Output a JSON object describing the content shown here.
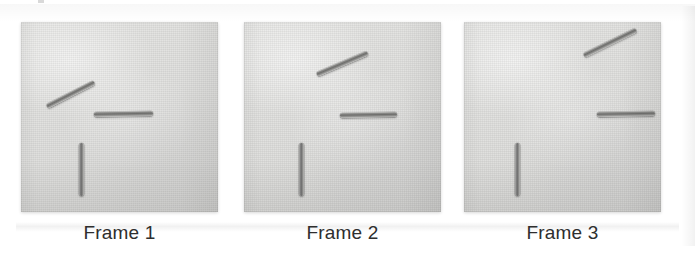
{
  "figure": {
    "background_color": "#ffffff",
    "board_color": "#e2e2e0",
    "rod_color": "#6e6e6c",
    "caption_color": "#2e2e2e",
    "frame_count": 3
  },
  "frames": [
    {
      "id": "frame-1",
      "caption": "Frame 1",
      "left": 21,
      "rods": [
        {
          "name": "diagonal-rod",
          "orientation": "diagonal",
          "x": 26,
          "y": 82,
          "length": 53,
          "thickness": 5,
          "angle_deg": -27
        },
        {
          "name": "horizontal-rod",
          "orientation": "horizontal",
          "x": 73,
          "y": 90,
          "length": 59,
          "thickness": 5,
          "angle_deg": -1
        },
        {
          "name": "vertical-rod",
          "orientation": "vertical",
          "x": 58,
          "y": 121,
          "length": 5,
          "thickness": 53,
          "angle_deg": 0
        }
      ]
    },
    {
      "id": "frame-2",
      "caption": "Frame 2",
      "left": 244,
      "rods": [
        {
          "name": "diagonal-rod",
          "orientation": "diagonal",
          "x": 73,
          "y": 50,
          "length": 55,
          "thickness": 5,
          "angle_deg": -23
        },
        {
          "name": "horizontal-rod",
          "orientation": "horizontal",
          "x": 96,
          "y": 91,
          "length": 57,
          "thickness": 5,
          "angle_deg": -1
        },
        {
          "name": "vertical-rod",
          "orientation": "vertical",
          "x": 55,
          "y": 121,
          "length": 5,
          "thickness": 53,
          "angle_deg": 0
        }
      ]
    },
    {
      "id": "frame-3",
      "caption": "Frame 3",
      "left": 464,
      "rods": [
        {
          "name": "diagonal-rod",
          "orientation": "diagonal",
          "x": 120,
          "y": 31,
          "length": 58,
          "thickness": 5,
          "angle_deg": -26
        },
        {
          "name": "horizontal-rod",
          "orientation": "horizontal",
          "x": 133,
          "y": 90,
          "length": 58,
          "thickness": 5,
          "angle_deg": -1
        },
        {
          "name": "vertical-rod",
          "orientation": "vertical",
          "x": 51,
          "y": 121,
          "length": 5,
          "thickness": 53,
          "angle_deg": 0
        }
      ]
    }
  ]
}
